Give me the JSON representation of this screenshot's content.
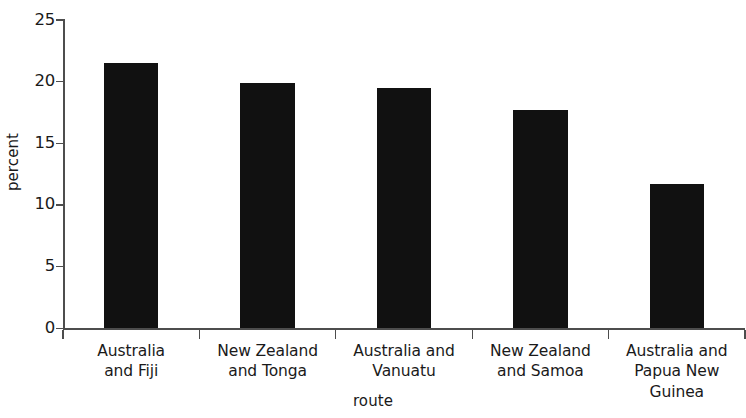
{
  "chart_data": {
    "type": "bar",
    "title": "",
    "subtitle": "",
    "xlabel": "route",
    "ylabel": "percent",
    "categories": [
      "Australia and Fiji",
      "New Zealand and Tonga",
      "Australia and Vanuatu",
      "New Zealand and Samoa",
      "Australia and Papua New Guinea"
    ],
    "category_lines": [
      [
        "Australia",
        "and Fiji"
      ],
      [
        "New Zealand",
        "and Tonga"
      ],
      [
        "Australia and",
        "Vanuatu"
      ],
      [
        "New Zealand",
        "and Samoa"
      ],
      [
        "Australia and",
        "Papua New Guinea"
      ]
    ],
    "values": [
      21.5,
      19.9,
      19.5,
      17.7,
      11.7
    ],
    "ylim": [
      0,
      25
    ],
    "yticks": [
      0,
      5,
      10,
      15,
      20,
      25
    ],
    "ytick_labels": [
      "0",
      "5",
      "10",
      "15",
      "20",
      "25"
    ],
    "grid": false,
    "legend": null,
    "bar_color": "#111111",
    "axis_color": "#4d4d4d",
    "background_color": "#ffffff"
  }
}
